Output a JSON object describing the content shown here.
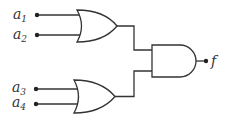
{
  "diagram": {
    "type": "logic-circuit",
    "inputs": [
      {
        "name": "a",
        "sub": "1",
        "y": 15
      },
      {
        "name": "a",
        "sub": "2",
        "y": 35
      },
      {
        "name": "a",
        "sub": "3",
        "y": 89
      },
      {
        "name": "a",
        "sub": "4",
        "y": 104
      }
    ],
    "gates": [
      {
        "id": "or1",
        "type": "OR",
        "inputs": [
          "a1",
          "a2"
        ]
      },
      {
        "id": "or2",
        "type": "OR",
        "inputs": [
          "a3",
          "a4"
        ]
      },
      {
        "id": "and1",
        "type": "AND",
        "inputs": [
          "or1",
          "or2"
        ]
      }
    ],
    "output": {
      "label": "f"
    },
    "colors": {
      "stroke": "#333333",
      "background": "#ffffff"
    }
  }
}
